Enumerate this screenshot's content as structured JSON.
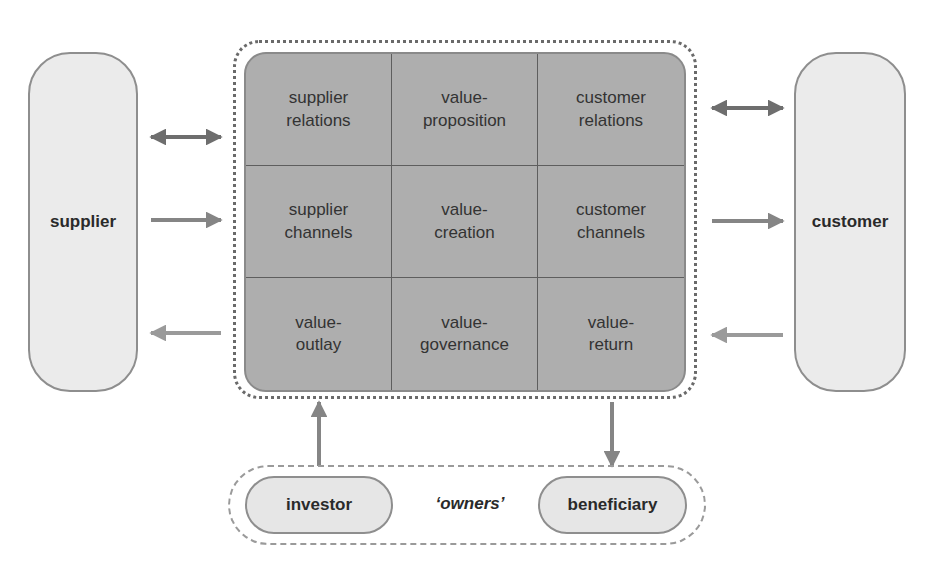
{
  "diagram": {
    "left_entity": {
      "label": "supplier"
    },
    "right_entity": {
      "label": "customer"
    },
    "grid": {
      "rows": [
        [
          {
            "label": "supplier\nrelations"
          },
          {
            "label": "value-\nproposition"
          },
          {
            "label": "customer\nrelations"
          }
        ],
        [
          {
            "label": "supplier\nchannels"
          },
          {
            "label": "value-\ncreation"
          },
          {
            "label": "customer\nchannels"
          }
        ],
        [
          {
            "label": "value-\noutlay"
          },
          {
            "label": "value-\ngovernance"
          },
          {
            "label": "value-\nreturn"
          }
        ]
      ]
    },
    "owners": {
      "group_label": "‘owners’",
      "left": {
        "label": "investor"
      },
      "right": {
        "label": "beneficiary"
      }
    },
    "arrows": [
      {
        "from": "supplier",
        "to": "supplier relations",
        "direction": "bidirectional"
      },
      {
        "from": "supplier",
        "to": "supplier channels",
        "direction": "right"
      },
      {
        "from": "value-outlay",
        "to": "supplier",
        "direction": "left"
      },
      {
        "from": "customer relations",
        "to": "customer",
        "direction": "bidirectional"
      },
      {
        "from": "customer channels",
        "to": "customer",
        "direction": "right"
      },
      {
        "from": "customer",
        "to": "value-return",
        "direction": "left"
      },
      {
        "from": "investor",
        "to": "value-outlay",
        "direction": "up"
      },
      {
        "from": "value-return",
        "to": "beneficiary",
        "direction": "down"
      }
    ],
    "colors": {
      "grid_fill": "#aeaeae",
      "entity_fill": "#ebebeb",
      "arrow_dark": "#6e6e6e",
      "arrow_light": "#9a9a9a"
    }
  }
}
